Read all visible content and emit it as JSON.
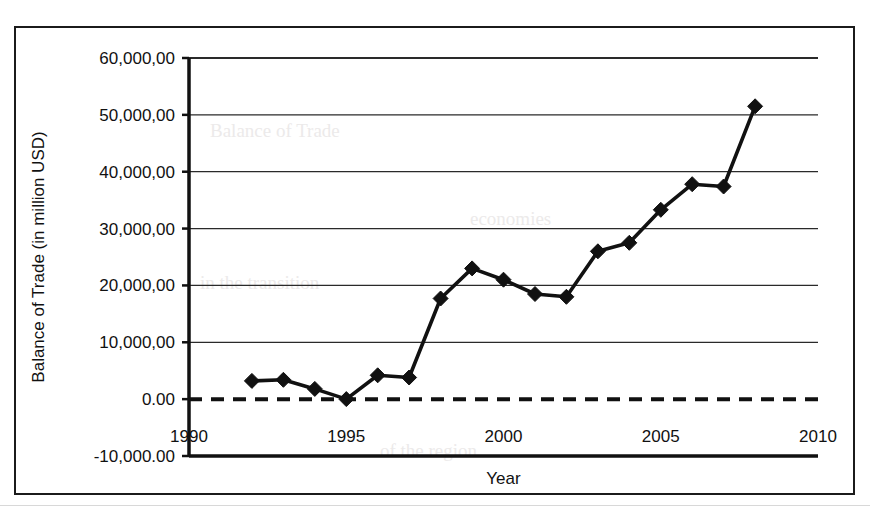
{
  "figure": {
    "frame_color": "#1b1b1b",
    "plot_bg": "#ffffff"
  },
  "chart_data": {
    "type": "line",
    "title": "",
    "xlabel": "Year",
    "ylabel": "Balance of Trade  (in million USD)",
    "xlim": [
      1990,
      2010
    ],
    "ylim": [
      -10000,
      60000
    ],
    "grid": true,
    "legend": "none",
    "marker": "diamond",
    "line_color": "#111111",
    "zero_line_style": "dashed",
    "xticks": [
      1990,
      1995,
      2000,
      2005,
      2010
    ],
    "xtick_labels": [
      "1990",
      "1995",
      "2000",
      "2005",
      "2010"
    ],
    "yticks": [
      -10000,
      0,
      10000,
      20000,
      30000,
      40000,
      50000,
      60000
    ],
    "ytick_labels": [
      "-10,000.00",
      "0.00",
      "10,000,00",
      "20,000,00",
      "30,000,00",
      "40,000,00",
      "50,000,00",
      "60,000,00"
    ],
    "x": [
      1992,
      1993,
      1994,
      1995,
      1996,
      1997,
      1998,
      1999,
      2000,
      2001,
      2002,
      2003,
      2004,
      2005,
      2006,
      2007,
      2008
    ],
    "values": [
      3200,
      3400,
      1800,
      0,
      4200,
      3800,
      17700,
      23000,
      21000,
      18500,
      18000,
      26000,
      27500,
      33300,
      37800,
      37400,
      51500
    ],
    "series": [
      {
        "name": "Balance of Trade",
        "values": [
          3200,
          3400,
          1800,
          0,
          4200,
          3800,
          17700,
          23000,
          21000,
          18500,
          18000,
          26000,
          27500,
          33300,
          37800,
          37400,
          51500
        ]
      }
    ]
  },
  "bleed_text": [
    "Balance of Trade",
    "in the transition",
    "economies",
    "of the region"
  ]
}
